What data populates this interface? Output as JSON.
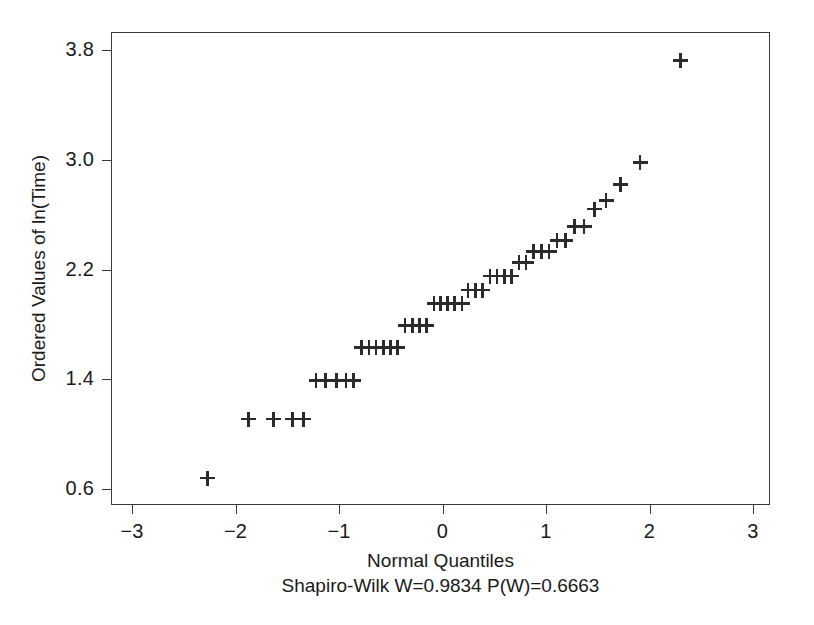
{
  "chart_data": {
    "type": "scatter",
    "title": "",
    "subtitle": "Shapiro-Wilk W=0.9834 P(W)=0.6663",
    "xlabel": "Normal Quantiles",
    "ylabel": "Ordered Values of ln(Time)",
    "xlim": [
      -3.2,
      3.2
    ],
    "ylim": [
      0.44,
      3.93
    ],
    "xticks": [
      -3,
      -2,
      -1,
      0,
      1,
      2,
      3
    ],
    "xticklabels": [
      "−3",
      "−2",
      "−1",
      "0",
      "1",
      "2",
      "3"
    ],
    "yticks": [
      0.6,
      1.4,
      2.2,
      3.0,
      3.8
    ],
    "yticklabels": [
      "0.6",
      "1.4",
      "2.2",
      "3.0",
      "3.8"
    ],
    "grid": false,
    "legend": null,
    "marker": "plus",
    "marker_color": "#2b2b2b",
    "axis_color": "#3a3a3a",
    "background": "#ffffff",
    "n_points": 46,
    "series": [
      {
        "name": "Ordered ln(Time) vs Normal Quantiles",
        "x": [
          -2.27,
          -1.87,
          -1.63,
          -1.45,
          -1.34,
          -1.22,
          -1.13,
          -1.02,
          -0.93,
          -0.86,
          -0.78,
          -0.71,
          -0.64,
          -0.57,
          -0.5,
          -0.43,
          -0.36,
          -0.29,
          -0.22,
          -0.15,
          -0.08,
          -0.02,
          0.05,
          0.12,
          0.19,
          0.25,
          0.32,
          0.39,
          0.46,
          0.53,
          0.6,
          0.67,
          0.74,
          0.81,
          0.88,
          0.96,
          1.03,
          1.11,
          1.19,
          1.28,
          1.37,
          1.47,
          1.58,
          1.72,
          1.91,
          2.3
        ],
        "y": [
          0.68,
          1.11,
          1.11,
          1.11,
          1.11,
          1.39,
          1.39,
          1.39,
          1.39,
          1.39,
          1.63,
          1.63,
          1.63,
          1.63,
          1.63,
          1.63,
          1.79,
          1.79,
          1.79,
          1.79,
          1.95,
          1.95,
          1.95,
          1.95,
          1.95,
          2.05,
          2.05,
          2.05,
          2.15,
          2.15,
          2.15,
          2.15,
          2.25,
          2.25,
          2.33,
          2.33,
          2.33,
          2.41,
          2.41,
          2.51,
          2.51,
          2.64,
          2.7,
          2.82,
          2.98,
          3.72
        ]
      }
    ],
    "notes": {
      "shapiro_wilk_W": "0.9834",
      "shapiro_wilk_P": "0.6663",
      "interpretation": "Ordered values of ln(Time) plotted against normal quantiles; discrete horizontal bands indicate tied values."
    }
  },
  "axes": {
    "ylabel": "Ordered Values of ln(Time)",
    "xlabel": "Normal Quantiles",
    "subtitle": "Shapiro-Wilk W=0.9834 P(W)=0.6663"
  }
}
